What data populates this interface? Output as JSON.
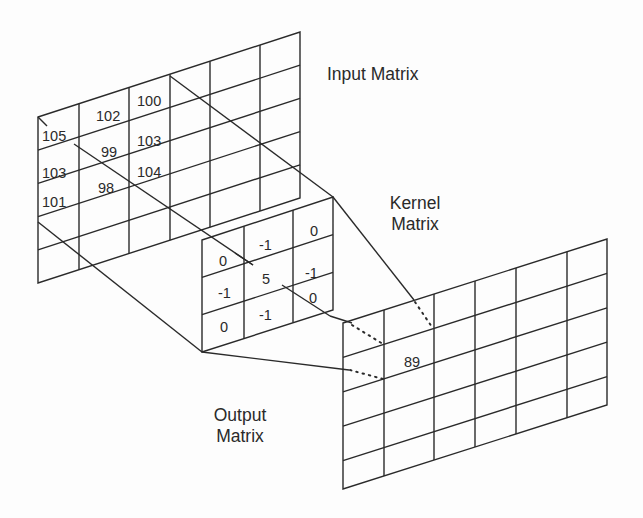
{
  "labels": {
    "input": "Input Matrix",
    "kernel_line1": "Kernel",
    "kernel_line2": "Matrix",
    "output_line1": "Output",
    "output_line2": "Matrix"
  },
  "input_matrix": {
    "rows": 5,
    "cols": 6,
    "visible_values": [
      [
        "105",
        "102",
        "100"
      ],
      [
        "103",
        "99",
        "103"
      ],
      [
        "101",
        "98",
        "104"
      ]
    ]
  },
  "kernel_matrix": {
    "rows": 3,
    "cols": 3,
    "values": [
      [
        "0",
        "-1",
        "0"
      ],
      [
        "-1",
        "5",
        "-1"
      ],
      [
        "0",
        "-1",
        "0"
      ]
    ]
  },
  "output_matrix": {
    "rows": 5,
    "cols": 6,
    "result_value": "89"
  },
  "colors": {
    "line": "#2a2a2a",
    "background": "#fdfdfd"
  }
}
